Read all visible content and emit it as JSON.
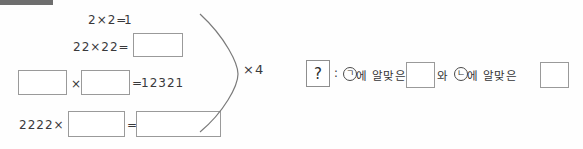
{
  "document": {
    "type": "math-worksheet-scan",
    "ink_color": "#39393b",
    "box_border_color": "#9a9a9a",
    "marker_bar_color": "#6e6e6e"
  },
  "equations": [
    {
      "id": "row-1",
      "left_text": "2×2=",
      "right_text": "1",
      "has_answer_box": false
    },
    {
      "id": "row-2",
      "left_text": "22×22=",
      "right_text": "",
      "has_answer_box": true
    },
    {
      "id": "row-3",
      "operator": "×",
      "equals": "=",
      "result": "12321",
      "has_answer_box": true
    },
    {
      "id": "row-4",
      "left_text": "2222×",
      "equals": "=",
      "has_answer_box": true
    }
  ],
  "brace": {
    "label": "×4"
  },
  "prompt": {
    "question_mark": "?",
    "colon": ":",
    "symbol_a": "ㄱ",
    "text_a": "에 알맞은",
    "conjunction": "와",
    "symbol_b": "ㄴ",
    "text_b": "에 알맞은"
  }
}
